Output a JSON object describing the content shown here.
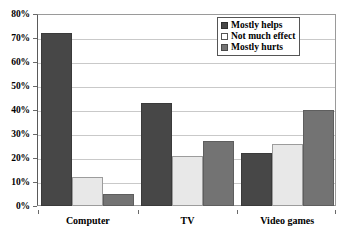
{
  "chart_data": {
    "type": "bar",
    "title": "",
    "xlabel": "",
    "ylabel": "",
    "categories": [
      "Computer",
      "TV",
      "Video games"
    ],
    "series": [
      {
        "name": "Mostly helps",
        "color": "#474747",
        "values": [
          72,
          43,
          22
        ]
      },
      {
        "name": "Not much effect",
        "color": "#e8e8e8",
        "values": [
          12,
          21,
          26
        ]
      },
      {
        "name": "Mostly hurts",
        "color": "#737373",
        "values": [
          5,
          27,
          40
        ]
      }
    ],
    "ylim": [
      0,
      80
    ],
    "ytick_values": [
      0,
      10,
      20,
      30,
      40,
      50,
      60,
      70,
      80
    ],
    "ytick_labels": [
      "0%",
      "10%",
      "20%",
      "30%",
      "40%",
      "50%",
      "60%",
      "70%",
      "80%"
    ],
    "grid": true,
    "legend_position": "top-right"
  },
  "legend": {
    "entries": [
      {
        "label": "Mostly helps"
      },
      {
        "label": "Not much effect"
      },
      {
        "label": "Mostly hurts"
      }
    ]
  }
}
